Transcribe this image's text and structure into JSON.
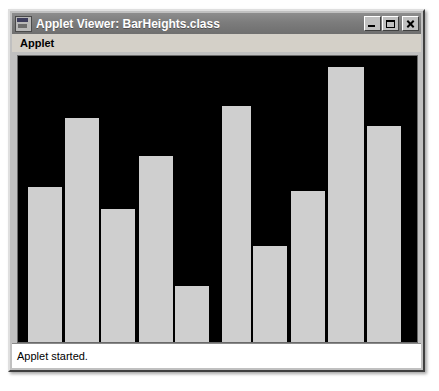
{
  "window": {
    "title": "Applet Viewer: BarHeights.class",
    "icon": "applet-viewer-icon",
    "controls": {
      "minimize_label": "",
      "maximize_label": "",
      "close_label": ""
    }
  },
  "menubar": {
    "items": [
      {
        "label": "Applet",
        "name": "menu-applet"
      }
    ]
  },
  "statusbar": {
    "text": "Applet started."
  },
  "colors": {
    "bar_fill": "#cfcfcf",
    "canvas_background": "#000000",
    "window_face": "#c0c0c0",
    "titlebar": "#7c7c7c",
    "titlebar_text": "#ffffff",
    "status_background": "#ffffff"
  },
  "chart_data": {
    "type": "bar",
    "title": "",
    "subtitle": "",
    "xlabel": "",
    "ylabel": "",
    "grid": false,
    "legend": "none",
    "categories": [
      "1",
      "2",
      "3",
      "4",
      "5",
      "6",
      "7",
      "8",
      "9",
      "10"
    ],
    "values": [
      155,
      224,
      133,
      186,
      56,
      236,
      96,
      151,
      275,
      216
    ],
    "ylim": [
      0,
      288
    ],
    "bar_color": "#cfcfcf",
    "background_color": "#000000",
    "bar_geometry": [
      {
        "index": 1,
        "x": 10,
        "width": 34,
        "top": 129,
        "height": 155
      },
      {
        "index": 2,
        "x": 47,
        "width": 34,
        "top": 60,
        "height": 224
      },
      {
        "index": 3,
        "x": 83,
        "width": 34,
        "top": 151,
        "height": 133
      },
      {
        "index": 4,
        "x": 121,
        "width": 34,
        "top": 98,
        "height": 186
      },
      {
        "index": 5,
        "x": 157,
        "width": 34,
        "top": 228,
        "height": 56
      },
      {
        "index": 6,
        "x": 204,
        "width": 29,
        "top": 48,
        "height": 236
      },
      {
        "index": 7,
        "x": 235,
        "width": 34,
        "top": 188,
        "height": 96
      },
      {
        "index": 8,
        "x": 273,
        "width": 34,
        "top": 133,
        "height": 151
      },
      {
        "index": 9,
        "x": 310,
        "width": 36,
        "top": 9,
        "height": 275
      },
      {
        "index": 10,
        "x": 349,
        "width": 34,
        "top": 68,
        "height": 216
      }
    ]
  }
}
